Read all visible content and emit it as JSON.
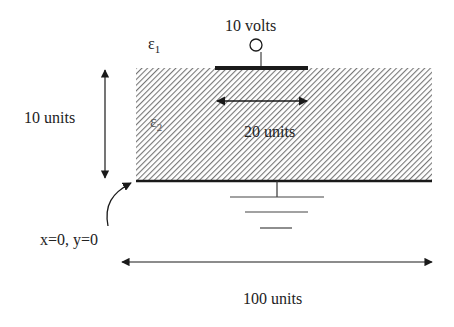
{
  "diagram": {
    "type": "electrostatics-geometry",
    "colors": {
      "line": "#1a1a1a",
      "hatch": "#777777",
      "background": "#ffffff"
    },
    "labels": {
      "voltage": "10 volts",
      "epsilon1_symbol": "ε",
      "epsilon1_sub": "1",
      "epsilon2_symbol": "ε",
      "epsilon2_sub": "2",
      "height": "10 units",
      "electrode_width": "20 units",
      "origin": "x=0, y=0",
      "total_width": "100 units"
    },
    "elements": {
      "dielectric_region": {
        "fill": "diagonal-hatch",
        "material": "ε2"
      },
      "top_electrode": {
        "potential": "10 volts"
      },
      "ground_plane": {
        "potential": "ground"
      }
    }
  }
}
